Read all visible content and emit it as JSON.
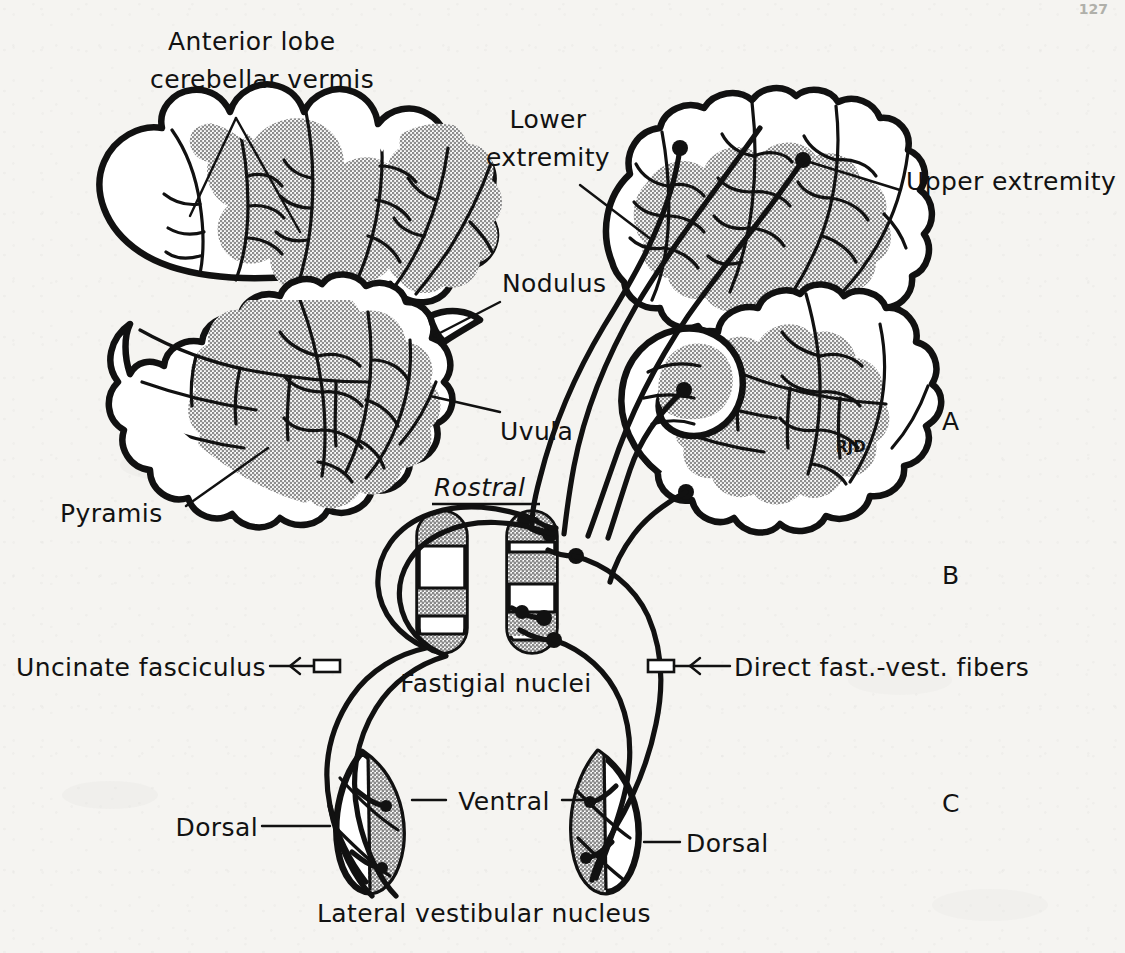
{
  "page": {
    "header_left": "",
    "header_center": "",
    "page_number": "127",
    "background_color": "#f5f4f1",
    "ink_color": "#111111",
    "shade_color": "#b6b6b6"
  },
  "figure": {
    "artist_signature": "RJD",
    "panels": [
      {
        "id": "A",
        "label": "A",
        "description": "Cerebellar vermis, sagittal folia sections"
      },
      {
        "id": "B",
        "label": "B",
        "description": "Fastigial nuclei with uncinate fasciculus and direct fastigiovestibular fibers"
      },
      {
        "id": "C",
        "label": "C",
        "description": "Lateral vestibular nucleus, dorsal and ventral parts"
      }
    ],
    "orientation_marker": {
      "text": "Rostral",
      "style": "italic-underlined"
    },
    "labels": [
      {
        "id": "anterior-lobe",
        "line1": "Anterior lobe",
        "line2": "cerebellar vermis",
        "anchor": "start"
      },
      {
        "id": "lower-extremity",
        "line1": "Lower",
        "line2": "extremity",
        "anchor": "middle"
      },
      {
        "id": "upper-extremity",
        "line1": "Upper extremity",
        "line2": "",
        "anchor": "start"
      },
      {
        "id": "nodulus",
        "line1": "Nodulus",
        "line2": "",
        "anchor": "start"
      },
      {
        "id": "uvula",
        "line1": "Uvula",
        "line2": "",
        "anchor": "start"
      },
      {
        "id": "pyramis",
        "line1": "Pyramis",
        "line2": "",
        "anchor": "start"
      },
      {
        "id": "uncinate-fasciculus",
        "line1": "Uncinate fasciculus",
        "line2": "",
        "anchor": "end"
      },
      {
        "id": "fastigial-nuclei",
        "line1": "Fastigial nuclei",
        "line2": "",
        "anchor": "middle"
      },
      {
        "id": "direct-fibers",
        "line1": "Direct fast.-vest. fibers",
        "line2": "",
        "anchor": "start"
      },
      {
        "id": "dorsal-left",
        "line1": "Dorsal",
        "line2": "",
        "anchor": "end"
      },
      {
        "id": "ventral",
        "line1": "Ventral",
        "line2": "",
        "anchor": "middle"
      },
      {
        "id": "dorsal-right",
        "line1": "Dorsal",
        "line2": "",
        "anchor": "start"
      },
      {
        "id": "lateral-vestibular",
        "line1": "Lateral vestibular nucleus",
        "line2": "",
        "anchor": "middle"
      }
    ],
    "text": {
      "anterior_lobe_1": "Anterior lobe",
      "anterior_lobe_2": "cerebellar vermis",
      "lower_1": "Lower",
      "lower_2": "extremity",
      "upper": "Upper extremity",
      "nodulus": "Nodulus",
      "uvula": "Uvula",
      "pyramis": "Pyramis",
      "rostral": "Rostral",
      "uncinate": "Uncinate fasciculus",
      "fastigial": "Fastigial nuclei",
      "direct": "Direct fast.-vest. fibers",
      "dorsal_left": "Dorsal",
      "ventral": "Ventral",
      "dorsal_right": "Dorsal",
      "lateral_vestibular": "Lateral vestibular nucleus",
      "panel_a": "A",
      "panel_b": "B",
      "panel_c": "C",
      "signature": "RJD",
      "page_number": "127"
    }
  }
}
